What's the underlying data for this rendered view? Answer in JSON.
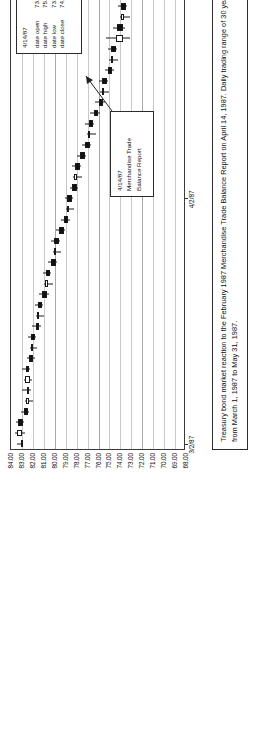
{
  "figure": {
    "caption_line1": "Treasury bond market reaction to the February 1987 Merchandise Trade Balance Report on April 14, 1987. Daily trading range of 30 year Treasury bond prices",
    "caption_line2": "from March 1, 1987 to May 31, 1987."
  },
  "callout_ohlc": {
    "date": "4/14/87",
    "rows": [
      {
        "label": "date open",
        "value": "73.72"
      },
      {
        "label": "date high",
        "value": "75.31"
      },
      {
        "label": "date low",
        "value": "73.16"
      },
      {
        "label": "date close",
        "value": "74.41"
      }
    ]
  },
  "callout_event": {
    "line1": "4/14/87",
    "line2": "Merchandise Trade",
    "line3": "Balance  Report"
  },
  "chart_data": {
    "type": "candlestick",
    "title": "",
    "xlabel": "",
    "ylabel": "",
    "orientation": "rotated-90-ccw",
    "grid": true,
    "legend": "none",
    "ylim": [
      68.0,
      84.0
    ],
    "yticks": [
      "84.00",
      "83.00",
      "82.00",
      "81.00",
      "80.00",
      "79.00",
      "78.00",
      "77.00",
      "76.00",
      "75.00",
      "74.00",
      "73.00",
      "72.00",
      "71.00",
      "70.00",
      "69.00",
      "68.00"
    ],
    "ytick_values": [
      84,
      83,
      82,
      81,
      80,
      79,
      78,
      77,
      76,
      75,
      74,
      73,
      72,
      71,
      70,
      69,
      68
    ],
    "xticks": [
      "3/2/87",
      "4/2/87",
      "5/2/87"
    ],
    "xtick_positions": [
      0,
      23,
      44
    ],
    "x_range_start": "3/2/87",
    "x_range_end": "5/31/87",
    "annotations": [
      {
        "date": "4/14/87",
        "text": "Merchandise Trade Balance Report",
        "open": 73.72,
        "high": 75.31,
        "low": 73.16,
        "close": 74.41
      }
    ],
    "series": [
      {
        "i": 0,
        "open": 83.1,
        "high": 83.45,
        "low": 82.9,
        "close": 83.0,
        "dir": "down"
      },
      {
        "i": 1,
        "open": 82.95,
        "high": 83.6,
        "low": 82.7,
        "close": 83.45,
        "dir": "up"
      },
      {
        "i": 2,
        "open": 83.4,
        "high": 83.55,
        "low": 82.8,
        "close": 82.9,
        "dir": "down"
      },
      {
        "i": 3,
        "open": 82.85,
        "high": 83.1,
        "low": 82.35,
        "close": 82.45,
        "dir": "down"
      },
      {
        "i": 4,
        "open": 82.4,
        "high": 82.7,
        "low": 81.95,
        "close": 82.6,
        "dir": "up"
      },
      {
        "i": 5,
        "open": 82.55,
        "high": 82.95,
        "low": 82.2,
        "close": 82.35,
        "dir": "down"
      },
      {
        "i": 6,
        "open": 82.3,
        "high": 82.8,
        "low": 82.05,
        "close": 82.7,
        "dir": "up"
      },
      {
        "i": 7,
        "open": 82.65,
        "high": 83.0,
        "low": 82.3,
        "close": 82.4,
        "dir": "down"
      },
      {
        "i": 8,
        "open": 82.35,
        "high": 82.55,
        "low": 81.85,
        "close": 82.0,
        "dir": "down"
      },
      {
        "i": 9,
        "open": 81.95,
        "high": 82.3,
        "low": 81.6,
        "close": 82.2,
        "dir": "up"
      },
      {
        "i": 10,
        "open": 82.15,
        "high": 82.45,
        "low": 81.7,
        "close": 81.8,
        "dir": "down"
      },
      {
        "i": 11,
        "open": 81.75,
        "high": 82.05,
        "low": 81.3,
        "close": 81.45,
        "dir": "down"
      },
      {
        "i": 12,
        "open": 81.4,
        "high": 81.7,
        "low": 80.95,
        "close": 81.6,
        "dir": "up"
      },
      {
        "i": 13,
        "open": 81.55,
        "high": 81.85,
        "low": 81.1,
        "close": 81.2,
        "dir": "down"
      },
      {
        "i": 14,
        "open": 81.15,
        "high": 81.4,
        "low": 80.55,
        "close": 80.7,
        "dir": "down"
      },
      {
        "i": 15,
        "open": 80.65,
        "high": 80.95,
        "low": 80.2,
        "close": 80.85,
        "dir": "up"
      },
      {
        "i": 16,
        "open": 80.8,
        "high": 81.05,
        "low": 80.3,
        "close": 80.4,
        "dir": "down"
      },
      {
        "i": 17,
        "open": 80.35,
        "high": 80.6,
        "low": 79.75,
        "close": 79.9,
        "dir": "down"
      },
      {
        "i": 18,
        "open": 79.85,
        "high": 80.2,
        "low": 79.4,
        "close": 80.1,
        "dir": "up"
      },
      {
        "i": 19,
        "open": 80.05,
        "high": 80.35,
        "low": 79.55,
        "close": 79.65,
        "dir": "down"
      },
      {
        "i": 20,
        "open": 79.6,
        "high": 79.9,
        "low": 79.05,
        "close": 79.2,
        "dir": "down"
      },
      {
        "i": 21,
        "open": 79.15,
        "high": 79.45,
        "low": 78.6,
        "close": 78.75,
        "dir": "down"
      },
      {
        "i": 22,
        "open": 78.7,
        "high": 79.0,
        "low": 78.2,
        "close": 78.9,
        "dir": "up"
      },
      {
        "i": 23,
        "open": 78.85,
        "high": 79.1,
        "low": 78.35,
        "close": 78.45,
        "dir": "down"
      },
      {
        "i": 24,
        "open": 78.4,
        "high": 78.65,
        "low": 77.85,
        "close": 78.0,
        "dir": "down"
      },
      {
        "i": 25,
        "open": 77.95,
        "high": 78.3,
        "low": 77.5,
        "close": 78.2,
        "dir": "up"
      },
      {
        "i": 26,
        "open": 78.15,
        "high": 78.4,
        "low": 77.6,
        "close": 77.7,
        "dir": "down"
      },
      {
        "i": 27,
        "open": 77.65,
        "high": 77.95,
        "low": 77.1,
        "close": 77.25,
        "dir": "down"
      },
      {
        "i": 28,
        "open": 77.2,
        "high": 77.5,
        "low": 76.65,
        "close": 76.8,
        "dir": "down"
      },
      {
        "i": 29,
        "open": 76.75,
        "high": 77.05,
        "low": 76.25,
        "close": 76.95,
        "dir": "up"
      },
      {
        "i": 30,
        "open": 76.9,
        "high": 77.2,
        "low": 76.4,
        "close": 76.5,
        "dir": "down"
      },
      {
        "i": 31,
        "open": 76.45,
        "high": 76.75,
        "low": 75.9,
        "close": 76.05,
        "dir": "down"
      },
      {
        "i": 32,
        "open": 76.0,
        "high": 76.3,
        "low": 75.45,
        "close": 75.6,
        "dir": "down"
      },
      {
        "i": 33,
        "open": 75.55,
        "high": 75.85,
        "low": 75.0,
        "close": 75.7,
        "dir": "up"
      },
      {
        "i": 34,
        "open": 75.65,
        "high": 75.95,
        "low": 75.1,
        "close": 75.2,
        "dir": "down"
      },
      {
        "i": 35,
        "open": 75.15,
        "high": 75.45,
        "low": 74.6,
        "close": 74.75,
        "dir": "down"
      },
      {
        "i": 36,
        "open": 74.7,
        "high": 75.0,
        "low": 74.2,
        "close": 74.9,
        "dir": "up"
      },
      {
        "i": 37,
        "open": 74.85,
        "high": 75.15,
        "low": 74.3,
        "close": 74.4,
        "dir": "down"
      },
      {
        "i": 38,
        "open": 73.72,
        "high": 75.31,
        "low": 73.16,
        "close": 74.41,
        "dir": "up"
      },
      {
        "i": 39,
        "open": 74.35,
        "high": 74.7,
        "low": 73.6,
        "close": 73.75,
        "dir": "down"
      },
      {
        "i": 40,
        "open": 73.7,
        "high": 74.05,
        "low": 73.1,
        "close": 73.95,
        "dir": "up"
      },
      {
        "i": 41,
        "open": 73.9,
        "high": 74.25,
        "low": 73.35,
        "close": 73.45,
        "dir": "down"
      },
      {
        "i": 42,
        "open": 73.4,
        "high": 73.75,
        "low": 72.85,
        "close": 73.0,
        "dir": "down"
      },
      {
        "i": 43,
        "open": 72.95,
        "high": 73.3,
        "low": 72.4,
        "close": 73.15,
        "dir": "up"
      },
      {
        "i": 44,
        "open": 73.1,
        "high": 73.45,
        "low": 72.55,
        "close": 72.65,
        "dir": "down"
      },
      {
        "i": 45,
        "open": 72.6,
        "high": 72.95,
        "low": 72.05,
        "close": 72.8,
        "dir": "up"
      },
      {
        "i": 46,
        "open": 72.75,
        "high": 73.1,
        "low": 72.2,
        "close": 72.3,
        "dir": "down"
      },
      {
        "i": 47,
        "open": 72.25,
        "high": 72.6,
        "low": 71.7,
        "close": 71.85,
        "dir": "down"
      },
      {
        "i": 48,
        "open": 71.8,
        "high": 72.15,
        "low": 71.25,
        "close": 72.0,
        "dir": "up"
      },
      {
        "i": 49,
        "open": 71.95,
        "high": 72.3,
        "low": 71.4,
        "close": 71.5,
        "dir": "down"
      },
      {
        "i": 50,
        "open": 71.45,
        "high": 71.8,
        "low": 70.9,
        "close": 71.65,
        "dir": "up"
      },
      {
        "i": 51,
        "open": 71.6,
        "high": 71.95,
        "low": 71.05,
        "close": 71.15,
        "dir": "down"
      },
      {
        "i": 52,
        "open": 71.1,
        "high": 71.5,
        "low": 70.55,
        "close": 71.35,
        "dir": "up"
      },
      {
        "i": 53,
        "open": 71.3,
        "high": 71.7,
        "low": 70.8,
        "close": 70.9,
        "dir": "down"
      },
      {
        "i": 54,
        "open": 70.85,
        "high": 71.25,
        "low": 70.35,
        "close": 71.1,
        "dir": "up"
      },
      {
        "i": 55,
        "open": 71.05,
        "high": 71.4,
        "low": 70.5,
        "close": 70.6,
        "dir": "down"
      },
      {
        "i": 56,
        "open": 70.55,
        "high": 70.95,
        "low": 70.05,
        "close": 70.8,
        "dir": "up"
      },
      {
        "i": 57,
        "open": 70.75,
        "high": 71.15,
        "low": 70.25,
        "close": 70.35,
        "dir": "down"
      },
      {
        "i": 58,
        "open": 70.3,
        "high": 70.7,
        "low": 69.85,
        "close": 70.55,
        "dir": "up"
      },
      {
        "i": 59,
        "open": 70.5,
        "high": 70.9,
        "low": 70.0,
        "close": 70.1,
        "dir": "down"
      },
      {
        "i": 60,
        "open": 70.05,
        "high": 70.45,
        "low": 69.6,
        "close": 70.3,
        "dir": "up"
      },
      {
        "i": 61,
        "open": 70.25,
        "high": 70.65,
        "low": 69.8,
        "close": 69.9,
        "dir": "down"
      },
      {
        "i": 62,
        "open": 69.85,
        "high": 70.25,
        "low": 69.4,
        "close": 70.15,
        "dir": "up"
      }
    ]
  }
}
